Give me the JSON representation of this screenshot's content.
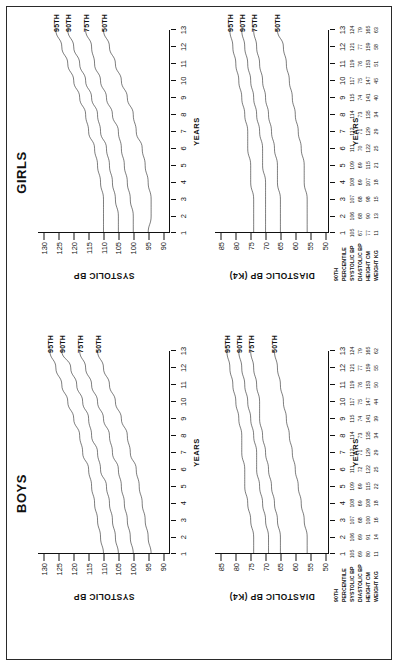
{
  "figure": {
    "axis_x_label": "YEARS",
    "x_ticks": [
      1,
      2,
      3,
      4,
      5,
      6,
      7,
      8,
      9,
      10,
      11,
      12,
      13
    ],
    "curve_labels": [
      "95TH",
      "90TH",
      "75TH",
      "50TH"
    ],
    "table_header": "90TH",
    "table_row_labels": [
      "PERCENTILE",
      "SYSTOLIC BP",
      "DIASTOLIC BP",
      "HEIGHT CM",
      "WEIGHT KG"
    ]
  },
  "panels": {
    "boys": {
      "title": "BOYS",
      "systolic": {
        "y_label": "SYSTOLIC BP",
        "y_ticks": [
          90,
          95,
          100,
          105,
          110,
          115,
          120,
          125,
          130
        ]
      },
      "diastolic": {
        "y_label": "DIASTOLIC BP (K4)",
        "y_ticks": [
          50,
          55,
          60,
          65,
          70,
          75,
          80,
          85
        ]
      }
    },
    "girls": {
      "title": "GIRLS",
      "systolic": {
        "y_label": "SYSTOLIC BP",
        "y_ticks": [
          90,
          95,
          100,
          105,
          110,
          115,
          120,
          125,
          130
        ]
      },
      "diastolic": {
        "y_label": "DIASTOLIC BP (K4)",
        "y_ticks": [
          50,
          55,
          60,
          65,
          70,
          75,
          80,
          85
        ]
      }
    }
  },
  "chart_data": [
    {
      "type": "line",
      "title": "BOYS",
      "subtitle": "SYSTOLIC BP",
      "xlabel": "YEARS",
      "ylabel": "SYSTOLIC BP",
      "x": [
        1,
        2,
        3,
        4,
        5,
        6,
        7,
        8,
        9,
        10,
        11,
        12,
        13
      ],
      "xlim": [
        1,
        13
      ],
      "ylim": [
        88,
        132
      ],
      "grid": false,
      "legend": "right end-of-curve labels",
      "series": [
        {
          "name": "95TH",
          "values": [
            110,
            111,
            112,
            113,
            114,
            115,
            117,
            118,
            120,
            122,
            124,
            126,
            128
          ]
        },
        {
          "name": "90TH",
          "values": [
            105,
            106,
            107,
            108,
            109,
            111,
            112,
            114,
            115,
            117,
            119,
            121,
            124
          ]
        },
        {
          "name": "75TH",
          "values": [
            100,
            101,
            102,
            103,
            104,
            105,
            107,
            108,
            110,
            112,
            114,
            116,
            118
          ]
        },
        {
          "name": "50TH",
          "values": [
            94,
            95,
            96,
            97,
            98,
            99,
            101,
            102,
            104,
            106,
            108,
            110,
            112
          ]
        }
      ]
    },
    {
      "type": "line",
      "title": "BOYS",
      "subtitle": "DIASTOLIC BP (K4)",
      "xlabel": "YEARS",
      "ylabel": "DIASTOLIC BP (K4)",
      "x": [
        1,
        2,
        3,
        4,
        5,
        6,
        7,
        8,
        9,
        10,
        11,
        12,
        13
      ],
      "xlim": [
        1,
        13
      ],
      "ylim": [
        49,
        87
      ],
      "grid": false,
      "series": [
        {
          "name": "95TH",
          "values": [
            74,
            74,
            75,
            76,
            77,
            77,
            78,
            78,
            79,
            80,
            81,
            82,
            83
          ]
        },
        {
          "name": "90TH",
          "values": [
            69,
            69,
            70,
            71,
            72,
            73,
            73,
            74,
            75,
            76,
            77,
            78,
            79
          ]
        },
        {
          "name": "75TH",
          "values": [
            65,
            65,
            66,
            67,
            68,
            69,
            70,
            71,
            72,
            72,
            73,
            74,
            75
          ]
        },
        {
          "name": "50TH",
          "values": [
            56,
            56,
            57,
            58,
            59,
            60,
            61,
            62,
            63,
            64,
            65,
            66,
            67
          ]
        }
      ]
    },
    {
      "type": "line",
      "title": "GIRLS",
      "subtitle": "SYSTOLIC BP",
      "xlabel": "YEARS",
      "ylabel": "SYSTOLIC BP",
      "x": [
        1,
        2,
        3,
        4,
        5,
        6,
        7,
        8,
        9,
        10,
        11,
        12,
        13
      ],
      "xlim": [
        1,
        13
      ],
      "ylim": [
        88,
        132
      ],
      "grid": false,
      "series": [
        {
          "name": "95TH",
          "values": [
            110,
            110,
            110,
            111,
            112,
            113,
            115,
            116,
            118,
            120,
            122,
            124,
            126
          ]
        },
        {
          "name": "90TH",
          "values": [
            105,
            105,
            106,
            107,
            108,
            109,
            111,
            112,
            114,
            116,
            118,
            120,
            122
          ]
        },
        {
          "name": "75TH",
          "values": [
            100,
            100,
            101,
            102,
            103,
            104,
            105,
            107,
            109,
            111,
            113,
            114,
            116
          ]
        },
        {
          "name": "50TH",
          "values": [
            95,
            94,
            94,
            95,
            96,
            97,
            99,
            100,
            102,
            104,
            106,
            108,
            110
          ]
        }
      ]
    },
    {
      "type": "line",
      "title": "GIRLS",
      "subtitle": "DIASTOLIC BP (K4)",
      "xlabel": "YEARS",
      "ylabel": "DIASTOLIC BP (K4)",
      "x": [
        1,
        2,
        3,
        4,
        5,
        6,
        7,
        8,
        9,
        10,
        11,
        12,
        13
      ],
      "xlim": [
        1,
        13
      ],
      "ylim": [
        49,
        87
      ],
      "grid": false,
      "series": [
        {
          "name": "95TH",
          "values": [
            74,
            74,
            74,
            75,
            75,
            76,
            76,
            77,
            78,
            79,
            80,
            81,
            82
          ]
        },
        {
          "name": "90TH",
          "values": [
            70,
            70,
            70,
            70,
            71,
            71,
            72,
            73,
            74,
            75,
            76,
            77,
            78
          ]
        },
        {
          "name": "75TH",
          "values": [
            65,
            65,
            65,
            66,
            66,
            67,
            68,
            69,
            70,
            71,
            72,
            73,
            74
          ]
        },
        {
          "name": "50TH",
          "values": [
            56,
            56,
            56,
            57,
            57,
            58,
            59,
            60,
            61,
            62,
            63,
            64,
            66
          ]
        }
      ]
    }
  ],
  "tables": {
    "boys": {
      "header": "90TH",
      "rows": [
        {
          "label": "PERCENTILE",
          "values": [
            "",
            "",
            "",
            "",
            "",
            "",
            "",
            "",
            "",
            "",
            "",
            "",
            ""
          ]
        },
        {
          "label": "SYSTOLIC BP",
          "values": [
            "105",
            "106",
            "107",
            "108",
            "109",
            "111",
            "112",
            "114",
            "115",
            "117",
            "119",
            "121",
            "124"
          ]
        },
        {
          "label": "DIASTOLIC BP",
          "values": [
            "69",
            "69",
            "68",
            "69",
            "69",
            "72",
            "71",
            "73",
            "74",
            "75",
            "76",
            "77",
            "79"
          ]
        },
        {
          "label": "HEIGHT CM",
          "values": [
            "80",
            "91",
            "100",
            "108",
            "115",
            "122",
            "129",
            "135",
            "141",
            "147",
            "153",
            "159",
            "165"
          ]
        },
        {
          "label": "WEIGHT KG",
          "values": [
            "11",
            "14",
            "16",
            "18",
            "22",
            "25",
            "29",
            "34",
            "39",
            "44",
            "50",
            "55",
            "62"
          ]
        }
      ]
    },
    "girls": {
      "header": "90TH",
      "rows": [
        {
          "label": "PERCENTILE",
          "values": [
            "",
            "",
            "",
            "",
            "",
            "",
            "",
            "",
            "",
            "",
            "",
            "",
            ""
          ]
        },
        {
          "label": "SYSTOLIC BP",
          "values": [
            "105",
            "106",
            "107",
            "108",
            "109",
            "111",
            "112",
            "114",
            "115",
            "117",
            "119",
            "121",
            "124"
          ]
        },
        {
          "label": "DIASTOLIC BP",
          "values": [
            "67",
            "68",
            "68",
            "69",
            "69",
            "70",
            "71",
            "73",
            "74",
            "75",
            "76",
            "77",
            "79"
          ]
        },
        {
          "label": "HEIGHT CM",
          "values": [
            "77",
            "90",
            "98",
            "107",
            "115",
            "122",
            "129",
            "135",
            "141",
            "147",
            "153",
            "159",
            "165"
          ]
        },
        {
          "label": "WEIGHT KG",
          "values": [
            "11",
            "13",
            "15",
            "18",
            "21",
            "25",
            "29",
            "34",
            "40",
            "45",
            "51",
            "58",
            "63"
          ]
        }
      ]
    }
  }
}
